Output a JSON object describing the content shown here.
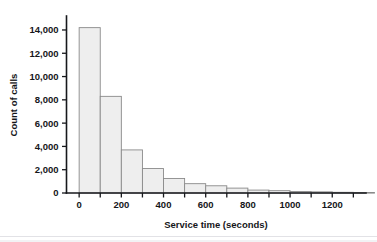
{
  "chart_data": {
    "type": "bar",
    "title": "",
    "subtitle": "",
    "xlabel": "Service time (seconds)",
    "ylabel": "Count of calls",
    "xlim": [
      -60,
      1360
    ],
    "ylim": [
      0,
      15200
    ],
    "grid": false,
    "legend": null,
    "bin_width": 100,
    "bin_starts": [
      0,
      100,
      200,
      300,
      400,
      500,
      600,
      700,
      800,
      900,
      1000,
      1100,
      1200,
      1300
    ],
    "categories": [
      "0-100",
      "100-200",
      "200-300",
      "300-400",
      "400-500",
      "500-600",
      "600-700",
      "700-800",
      "800-900",
      "900-1000",
      "1000-1100",
      "1100-1200",
      "1200-1300",
      "1300-1400"
    ],
    "values": [
      14200,
      8300,
      3700,
      2100,
      1250,
      800,
      620,
      420,
      250,
      200,
      130,
      100,
      60,
      40
    ],
    "x_tick_values": [
      0,
      100,
      200,
      300,
      400,
      500,
      600,
      700,
      800,
      900,
      1000,
      1100,
      1200,
      1300
    ],
    "x_tick_labels": [
      "0",
      "",
      "200",
      "",
      "400",
      "",
      "600",
      "",
      "800",
      "",
      "1000",
      "",
      "1200",
      ""
    ],
    "y_tick_values": [
      0,
      2000,
      4000,
      6000,
      8000,
      10000,
      12000,
      14000
    ],
    "y_tick_labels": [
      "0",
      "2,000",
      "4,000",
      "6,000",
      "8,000",
      "10,000",
      "12,000",
      "14,000"
    ],
    "colors": {
      "bar_fill": "#eeeeee",
      "bar_border": "#8a8a8a",
      "axis": "#17181c",
      "text": "#15161a",
      "background": "#ffffff"
    }
  }
}
